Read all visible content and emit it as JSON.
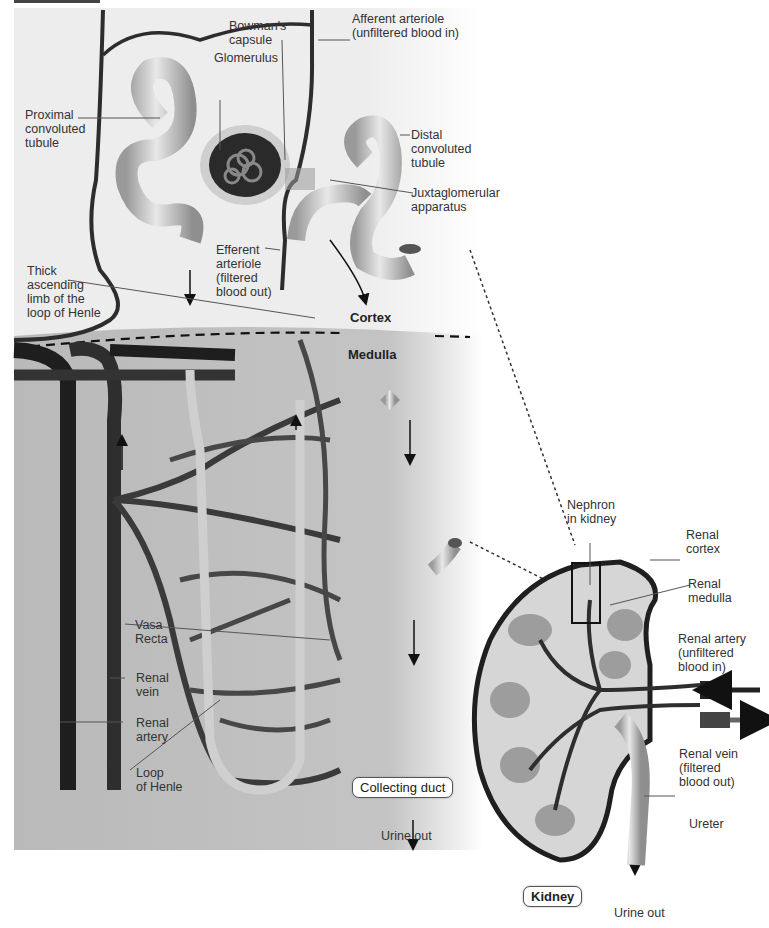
{
  "figure": {
    "zones": {
      "cortex": "Cortex",
      "medulla": "Medulla"
    },
    "colors": {
      "cortex_bg": "#ededed",
      "medulla_bg": "#b9b9b9",
      "vessel_dark": "#3a3a3a",
      "vessel_mid": "#5a5a5a",
      "tubule": "#bdbdbd",
      "tubule_highlight": "#e6e6e6",
      "kidney_cortex": "#d9d9d9",
      "kidney_outline": "#2b2b2b"
    },
    "nephron_labels": {
      "bowmans_capsule": "Bowman's\ncapsule",
      "glomerulus": "Glomerulus",
      "afferent_arteriole": "Afferent arteriole\n(unfiltered blood in)",
      "proximal_tubule": "Proximal\nconvoluted\ntubule",
      "distal_tubule": "Distal\nconvoluted\ntubule",
      "juxtaglomerular": "Juxtaglomerular\napparatus",
      "efferent_arteriole": "Efferent\narteriole\n(filtered\nblood out)",
      "thick_ascending_limb": "Thick\nascending\nlimb of the\nloop of Henle",
      "vasa_recta": "Vasa\nRecta",
      "renal_vein": "Renal\nvein",
      "renal_artery": "Renal\nartery",
      "loop_of_henle": "Loop\nof Henle",
      "collecting_duct": "Collecting duct",
      "urine_out": "Urine out"
    },
    "kidney_labels": {
      "nephron_in_kidney": "Nephron\nin kidney",
      "renal_cortex": "Renal\ncortex",
      "renal_medulla": "Renal\nmedulla",
      "renal_artery": "Renal artery\n(unfiltered\nblood in)",
      "renal_vein": "Renal vein\n(filtered\nblood out)",
      "ureter": "Ureter",
      "kidney": "Kidney",
      "urine_out": "Urine out"
    }
  }
}
